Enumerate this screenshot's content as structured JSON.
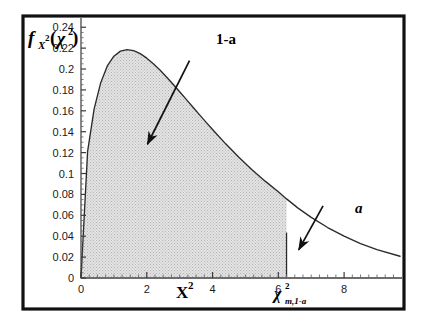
{
  "figure": {
    "frame_color": "#111111",
    "background": "#ffffff",
    "shade_color": "#c9c9c9",
    "curve_color": "#2b2b2b"
  },
  "labels": {
    "y_axis_f": "f",
    "y_axis_sub": "X",
    "y_axis_sub_exp": "2",
    "y_axis_arg_open": "(",
    "y_axis_arg_chi": "χ",
    "y_axis_arg_exp": "2",
    "y_axis_arg_close": ")",
    "x_axis_name": "X",
    "x_axis_name_exp": "2",
    "crit_chi": "χ",
    "crit_exp": "2",
    "crit_sub": "m,1-a",
    "anno_body": "1-a",
    "anno_tail": "a"
  },
  "chart_data": {
    "type": "area",
    "xlabel": "X2",
    "ylabel": "fX2(chi2)",
    "xlim": [
      0,
      9.7
    ],
    "ylim": [
      0,
      0.245
    ],
    "grid": false,
    "legend": "none",
    "distribution": "chi-square",
    "degrees_of_freedom": 3,
    "peak": {
      "x": 1.0,
      "y": 0.242
    },
    "critical_value": {
      "x": 6.25,
      "y": 0.0435,
      "label": "chi2_{m,1-a}"
    },
    "shaded_area_label": "1-a",
    "tail_area_label": "a",
    "x_ticks": [
      0,
      2,
      4,
      6,
      8
    ],
    "x_minor_step": 0.25,
    "y_ticks": [
      0,
      0.02,
      0.04,
      0.06,
      0.08,
      0.1,
      0.12,
      0.14,
      0.16,
      0.18,
      0.2,
      0.22,
      0.24
    ],
    "y_tick_labels": [
      "0",
      "0.02",
      "0.04",
      "0.06",
      "0.08",
      "0.1",
      "0.12",
      "0.14",
      "0.16",
      "0.18",
      "0.2",
      "0.22",
      "0.24"
    ],
    "y_minor_step": 0.005,
    "x": [
      0,
      0.2,
      0.4,
      0.6,
      0.8,
      1.0,
      1.2,
      1.4,
      1.6,
      1.8,
      2.0,
      2.2,
      2.4,
      2.6,
      2.8,
      3.0,
      3.2,
      3.4,
      3.6,
      3.8,
      4.0,
      4.4,
      4.8,
      5.2,
      5.6,
      6.0,
      6.25,
      6.6,
      7.0,
      7.5,
      8.0,
      8.5,
      9.0,
      9.7
    ],
    "y": [
      0,
      0.1209,
      0.1619,
      0.1869,
      0.2029,
      0.2123,
      0.2171,
      0.2186,
      0.2176,
      0.2147,
      0.2104,
      0.205,
      0.199,
      0.1924,
      0.1854,
      0.1783,
      0.171,
      0.1637,
      0.1564,
      0.1492,
      0.1421,
      0.1284,
      0.1156,
      0.1037,
      0.0927,
      0.0826,
      0.0757,
      0.0669,
      0.058,
      0.0483,
      0.04,
      0.033,
      0.0271,
      0.0208
    ],
    "annotations": [
      {
        "text": "1-a",
        "text_xy": [
          3.55,
          0.225
        ],
        "arrow_from": [
          3.3,
          0.208
        ],
        "arrow_to": [
          2.02,
          0.128
        ]
      },
      {
        "text": "a",
        "text_xy": [
          7.5,
          0.077
        ],
        "arrow_from": [
          7.36,
          0.069
        ],
        "arrow_to": [
          6.62,
          0.027
        ]
      }
    ]
  }
}
